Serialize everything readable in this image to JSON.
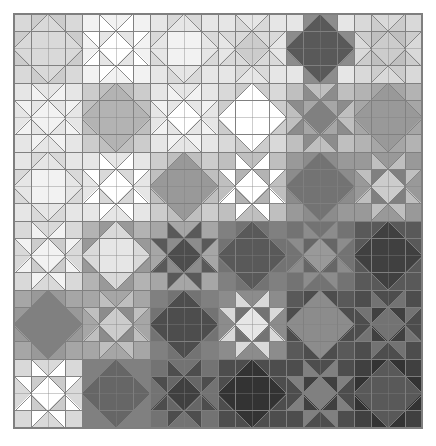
{
  "figure": {
    "name": "quilt-pattern",
    "canvas_width": 436,
    "canvas_height": 446,
    "background_color": "#ffffff"
  },
  "chart_data": {
    "type": "heatmap",
    "title": "",
    "xlabel": "",
    "ylabel": "",
    "grid": true,
    "legend": "none",
    "layout": {
      "origin_x": 14,
      "origin_y": 14,
      "grid_width": 408,
      "grid_height": 414,
      "blocks_across": 6,
      "blocks_down": 6,
      "block_px_w": 68,
      "block_px_h": 69,
      "cells_per_block": 4,
      "stroke_color": "#7f7f7f",
      "stroke_width": 0.9
    },
    "palette": {
      "p0": "#ffffff",
      "p1": "#f2f2f2",
      "p2": "#e6e6e6",
      "p3": "#d9d9d9",
      "p4": "#cccccc",
      "p5": "#bfbfbf",
      "p6": "#b3b3b3",
      "p7": "#a6a6a6",
      "p8": "#999999",
      "p9": "#8c8c8c",
      "p10": "#808080",
      "p11": "#737373",
      "p12": "#666666",
      "p13": "#595959",
      "p14": "#4d4d4d",
      "p15": "#404040",
      "p16": "#333333",
      "p17": "#262626"
    },
    "block_types": [
      "star",
      "diamond"
    ],
    "categories": [
      "r0c0",
      "r0c1",
      "r0c2",
      "r0c3",
      "r0c4",
      "r0c5",
      "r1c0",
      "r1c1",
      "r1c2",
      "r1c3",
      "r1c4",
      "r1c5",
      "r2c0",
      "r2c1",
      "r2c2",
      "r2c3",
      "r2c4",
      "r2c5",
      "r3c0",
      "r3c1",
      "r3c2",
      "r3c3",
      "r3c4",
      "r3c5",
      "r4c0",
      "r4c1",
      "r4c2",
      "r4c3",
      "r4c4",
      "r4c5",
      "r5c0",
      "r5c1",
      "r5c2",
      "r5c3",
      "r5c4",
      "r5c5"
    ],
    "values": [
      1,
      2,
      2,
      3,
      3,
      4,
      2,
      3,
      3,
      4,
      5,
      5,
      3,
      4,
      5,
      6,
      7,
      8,
      5,
      6,
      7,
      9,
      10,
      11,
      7,
      9,
      10,
      12,
      13,
      14,
      9,
      11,
      12,
      14,
      15,
      16
    ],
    "blocks": [
      {
        "row": 0,
        "col": 0,
        "type": "star",
        "bg": "#e6e6e6",
        "star": "#d9d9d9",
        "center": "#d9d9d9",
        "point": "#cccccc",
        "corner": "#d9d9d9"
      },
      {
        "row": 0,
        "col": 1,
        "type": "diamond",
        "bg": "#e6e6e6",
        "star": "#ffffff",
        "center": "#ffffff",
        "point": "#e6e6e6",
        "corner": "#f2f2f2"
      },
      {
        "row": 0,
        "col": 2,
        "type": "star",
        "bg": "#f2f2f2",
        "star": "#e6e6e6",
        "center": "#f2f2f2",
        "point": "#d9d9d9",
        "corner": "#e6e6e6"
      },
      {
        "row": 0,
        "col": 3,
        "type": "diamond",
        "bg": "#e6e6e6",
        "star": "#d9d9d9",
        "center": "#cccccc",
        "point": "#d9d9d9",
        "corner": "#e6e6e6"
      },
      {
        "row": 0,
        "col": 4,
        "type": "star",
        "bg": "#f2f2f2",
        "star": "#595959",
        "center": "#595959",
        "point": "#8c8c8c",
        "corner": "#e6e6e6"
      },
      {
        "row": 0,
        "col": 5,
        "type": "diamond",
        "bg": "#d9d9d9",
        "star": "#cccccc",
        "center": "#cccccc",
        "point": "#bfbfbf",
        "corner": "#d9d9d9"
      },
      {
        "row": 1,
        "col": 0,
        "type": "diamond",
        "bg": "#e6e6e6",
        "star": "#f2f2f2",
        "center": "#f2f2f2",
        "point": "#e6e6e6",
        "corner": "#e6e6e6"
      },
      {
        "row": 1,
        "col": 1,
        "type": "star",
        "bg": "#d9d9d9",
        "star": "#b3b3b3",
        "center": "#b3b3b3",
        "point": "#bfbfbf",
        "corner": "#cccccc"
      },
      {
        "row": 1,
        "col": 2,
        "type": "diamond",
        "bg": "#e6e6e6",
        "star": "#f2f2f2",
        "center": "#ffffff",
        "point": "#e6e6e6",
        "corner": "#e6e6e6"
      },
      {
        "row": 1,
        "col": 3,
        "type": "star",
        "bg": "#e6e6e6",
        "star": "#ffffff",
        "center": "#ffffff",
        "point": "#cccccc",
        "corner": "#d9d9d9"
      },
      {
        "row": 1,
        "col": 4,
        "type": "diamond",
        "bg": "#cccccc",
        "star": "#8c8c8c",
        "center": "#808080",
        "point": "#a6a6a6",
        "corner": "#bfbfbf"
      },
      {
        "row": 1,
        "col": 5,
        "type": "star",
        "bg": "#bfbfbf",
        "star": "#999999",
        "center": "#999999",
        "point": "#a6a6a6",
        "corner": "#b3b3b3"
      },
      {
        "row": 2,
        "col": 0,
        "type": "star",
        "bg": "#f2f2f2",
        "star": "#e6e6e6",
        "center": "#f2f2f2",
        "point": "#d9d9d9",
        "corner": "#e6e6e6"
      },
      {
        "row": 2,
        "col": 1,
        "type": "diamond",
        "bg": "#e6e6e6",
        "star": "#ffffff",
        "center": "#ffffff",
        "point": "#d9d9d9",
        "corner": "#e6e6e6"
      },
      {
        "row": 2,
        "col": 2,
        "type": "star",
        "bg": "#d9d9d9",
        "star": "#999999",
        "center": "#999999",
        "point": "#bfbfbf",
        "corner": "#cccccc"
      },
      {
        "row": 2,
        "col": 3,
        "type": "diamond",
        "bg": "#cccccc",
        "star": "#ffffff",
        "center": "#ffffff",
        "point": "#b3b3b3",
        "corner": "#bfbfbf"
      },
      {
        "row": 2,
        "col": 4,
        "type": "star",
        "bg": "#a6a6a6",
        "star": "#737373",
        "center": "#737373",
        "point": "#8c8c8c",
        "corner": "#999999"
      },
      {
        "row": 2,
        "col": 5,
        "type": "diamond",
        "bg": "#8c8c8c",
        "star": "#bfbfbf",
        "center": "#cccccc",
        "point": "#808080",
        "corner": "#999999"
      },
      {
        "row": 3,
        "col": 0,
        "type": "diamond",
        "bg": "#d9d9d9",
        "star": "#f2f2f2",
        "center": "#f2f2f2",
        "point": "#cccccc",
        "corner": "#d9d9d9"
      },
      {
        "row": 3,
        "col": 1,
        "type": "star",
        "bg": "#bfbfbf",
        "star": "#d9d9d9",
        "center": "#e6e6e6",
        "point": "#999999",
        "corner": "#b3b3b3"
      },
      {
        "row": 3,
        "col": 2,
        "type": "diamond",
        "bg": "#b3b3b3",
        "star": "#595959",
        "center": "#4d4d4d",
        "point": "#8c8c8c",
        "corner": "#a6a6a6"
      },
      {
        "row": 3,
        "col": 3,
        "type": "star",
        "bg": "#8c8c8c",
        "star": "#595959",
        "center": "#595959",
        "point": "#737373",
        "corner": "#808080"
      },
      {
        "row": 3,
        "col": 4,
        "type": "diamond",
        "bg": "#737373",
        "star": "#8c8c8c",
        "center": "#999999",
        "point": "#666666",
        "corner": "#737373"
      },
      {
        "row": 3,
        "col": 5,
        "type": "star",
        "bg": "#666666",
        "star": "#404040",
        "center": "#404040",
        "point": "#595959",
        "corner": "#595959"
      },
      {
        "row": 4,
        "col": 0,
        "type": "star",
        "bg": "#b3b3b3",
        "star": "#808080",
        "center": "#808080",
        "point": "#999999",
        "corner": "#a6a6a6"
      },
      {
        "row": 4,
        "col": 1,
        "type": "diamond",
        "bg": "#999999",
        "star": "#bfbfbf",
        "center": "#cccccc",
        "point": "#8c8c8c",
        "corner": "#a6a6a6"
      },
      {
        "row": 4,
        "col": 2,
        "type": "star",
        "bg": "#8c8c8c",
        "star": "#4d4d4d",
        "center": "#4d4d4d",
        "point": "#737373",
        "corner": "#808080"
      },
      {
        "row": 4,
        "col": 3,
        "type": "diamond",
        "bg": "#808080",
        "star": "#d9d9d9",
        "center": "#e6e6e6",
        "point": "#737373",
        "corner": "#8c8c8c"
      },
      {
        "row": 4,
        "col": 4,
        "type": "star",
        "bg": "#666666",
        "star": "#8c8c8c",
        "center": "#8c8c8c",
        "point": "#4d4d4d",
        "corner": "#595959"
      },
      {
        "row": 4,
        "col": 5,
        "type": "diamond",
        "bg": "#4d4d4d",
        "star": "#737373",
        "center": "#737373",
        "point": "#404040",
        "corner": "#4d4d4d"
      },
      {
        "row": 5,
        "col": 0,
        "type": "diamond",
        "bg": "#e6e6e6",
        "star": "#ffffff",
        "center": "#ffffff",
        "point": "#cccccc",
        "corner": "#d9d9d9"
      },
      {
        "row": 5,
        "col": 1,
        "type": "star",
        "bg": "#8c8c8c",
        "star": "#666666",
        "center": "#666666",
        "point": "#808080",
        "corner": "#808080"
      },
      {
        "row": 5,
        "col": 2,
        "type": "diamond",
        "bg": "#737373",
        "star": "#4d4d4d",
        "center": "#404040",
        "point": "#666666",
        "corner": "#737373"
      },
      {
        "row": 5,
        "col": 3,
        "type": "star",
        "bg": "#595959",
        "star": "#333333",
        "center": "#333333",
        "point": "#4d4d4d",
        "corner": "#4d4d4d"
      },
      {
        "row": 5,
        "col": 4,
        "type": "diamond",
        "bg": "#4d4d4d",
        "star": "#808080",
        "center": "#808080",
        "point": "#404040",
        "corner": "#4d4d4d"
      },
      {
        "row": 5,
        "col": 5,
        "type": "star",
        "bg": "#404040",
        "star": "#595959",
        "center": "#595959",
        "point": "#333333",
        "corner": "#404040"
      }
    ],
    "sashing_rows": [
      {
        "index": 0,
        "colors": [
          "#cccccc",
          "#e6e6e6",
          "#e6e6e6",
          "#d9d9d9",
          "#cccccc",
          "#e6e6e6",
          "#f2f2f2",
          "#e6e6e6",
          "#ffffff",
          "#f2f2f2",
          "#e6e6e6",
          "#d9d9d9",
          "#cccccc",
          "#e6e6e6",
          "#d9d9d9",
          "#f2f2f2",
          "#e6e6e6",
          "#ffffff",
          "#d9d9d9",
          "#cccccc",
          "#e6e6e6",
          "#d9d9d9",
          "#cccccc",
          "#bfbfbf"
        ]
      },
      {
        "index": 1,
        "colors": [
          "#d9d9d9",
          "#e6e6e6",
          "#f2f2f2",
          "#e6e6e6",
          "#d9d9d9",
          "#f2f2f2",
          "#e6e6e6",
          "#d9d9d9",
          "#f2f2f2",
          "#e6e6e6",
          "#d9d9d9",
          "#cccccc",
          "#d9d9d9",
          "#cccccc",
          "#bfbfbf",
          "#cccccc",
          "#bfbfbf",
          "#b3b3b3",
          "#cccccc",
          "#bfbfbf",
          "#b3b3b3",
          "#bfbfbf",
          "#b3b3b3",
          "#a6a6a6"
        ]
      },
      {
        "index": 2,
        "colors": [
          "#e6e6e6",
          "#f2f2f2",
          "#e6e6e6",
          "#d9d9d9",
          "#e6e6e6",
          "#f2f2f2",
          "#d9d9d9",
          "#cccccc",
          "#e6e6e6",
          "#d9d9d9",
          "#cccccc",
          "#bfbfbf",
          "#b3b3b3",
          "#a6a6a6",
          "#999999",
          "#a6a6a6",
          "#999999",
          "#8c8c8c",
          "#999999",
          "#8c8c8c",
          "#808080",
          "#8c8c8c",
          "#808080",
          "#737373"
        ]
      },
      {
        "index": 3,
        "colors": [
          "#cccccc",
          "#d9d9d9",
          "#cccccc",
          "#bfbfbf",
          "#b3b3b3",
          "#cccccc",
          "#a6a6a6",
          "#999999",
          "#8c8c8c",
          "#808080",
          "#737373",
          "#808080",
          "#737373",
          "#666666",
          "#737373",
          "#666666",
          "#595959",
          "#666666",
          "#595959",
          "#4d4d4d",
          "#595959",
          "#4d4d4d",
          "#404040",
          "#4d4d4d"
        ]
      },
      {
        "index": 4,
        "colors": [
          "#b3b3b3",
          "#a6a6a6",
          "#999999",
          "#a6a6a6",
          "#999999",
          "#8c8c8c",
          "#808080",
          "#737373",
          "#808080",
          "#737373",
          "#666666",
          "#737373",
          "#666666",
          "#595959",
          "#666666",
          "#595959",
          "#4d4d4d",
          "#595959",
          "#4d4d4d",
          "#404040",
          "#4d4d4d",
          "#404040",
          "#333333",
          "#404040"
        ]
      },
      {
        "index": 5,
        "colors": [
          "#e6e6e6",
          "#d9d9d9",
          "#cccccc",
          "#8c8c8c",
          "#808080",
          "#8c8c8c",
          "#737373",
          "#666666",
          "#737373",
          "#595959",
          "#4d4d4d",
          "#595959",
          "#4d4d4d",
          "#404040",
          "#4d4d4d",
          "#404040",
          "#333333",
          "#404040",
          "#4d4d4d",
          "#404040",
          "#333333",
          "#404040",
          "#333333",
          "#262626"
        ]
      }
    ]
  }
}
